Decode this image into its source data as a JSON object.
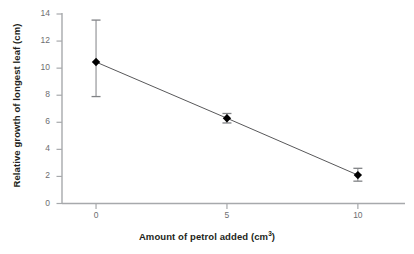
{
  "chart_data": {
    "type": "line",
    "title": "",
    "xlabel": "Amount of petrol added (cm3)",
    "xlabel_main": "Amount of petrol added (cm",
    "xlabel_sup": "3",
    "xlabel_tail": ")",
    "ylabel": "Relative growth of longest leaf (cm)",
    "x": [
      0,
      5,
      10
    ],
    "values": [
      10.45,
      6.3,
      2.1
    ],
    "error_upper": [
      3.1,
      0.35,
      0.5
    ],
    "error_lower": [
      2.55,
      0.35,
      0.45
    ],
    "xticks": [
      "0",
      "5",
      "10"
    ],
    "yticks": [
      "0",
      "2",
      "4",
      "6",
      "8",
      "10",
      "12",
      "14"
    ],
    "xlim": [
      -1.3,
      11.8
    ],
    "ylim": [
      0,
      14
    ],
    "grid": false,
    "legend": "none",
    "marker": "diamond",
    "marker_color": "#000000",
    "line_color": "#58585a",
    "axis_color": "#a7a9ac",
    "error_bar_color": "#808285",
    "background": "#ffffff"
  }
}
